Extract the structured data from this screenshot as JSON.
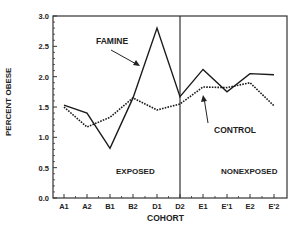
{
  "chart_data": {
    "type": "line",
    "title": "",
    "xlabel": "COHORT",
    "ylabel": "PERCENT OBESE",
    "ylim": [
      0.0,
      3.0
    ],
    "yticks": [
      "0.0",
      "0.5",
      "1.0",
      "1.5",
      "2.0",
      "2.5",
      "3.0"
    ],
    "categories": [
      "A1",
      "A2",
      "B1",
      "B2",
      "D1",
      "D2",
      "E1",
      "E'1",
      "E2",
      "E'2"
    ],
    "series": [
      {
        "name": "FAMINE",
        "style": "solid",
        "values": [
          1.53,
          1.4,
          0.82,
          1.65,
          2.8,
          1.67,
          2.12,
          1.75,
          2.05,
          2.03
        ]
      },
      {
        "name": "CONTROL",
        "style": "dotted",
        "values": [
          1.5,
          1.17,
          1.33,
          1.65,
          1.45,
          1.55,
          1.83,
          1.82,
          1.9,
          1.52
        ]
      }
    ],
    "annotations": [
      {
        "text": "FAMINE",
        "points_to": "famine line near D1"
      },
      {
        "text": "CONTROL",
        "points_to": "control line near E1"
      },
      {
        "text": "EXPOSED",
        "region": "A1–D2"
      },
      {
        "text": "NONEXPOSED",
        "region": "D2–E'2"
      }
    ],
    "divider_at": "D2",
    "grid": false,
    "legend": "none"
  },
  "labels": {
    "famine": "FAMINE",
    "control": "CONTROL",
    "exposed": "EXPOSED",
    "nonexposed": "NONEXPOSED"
  },
  "colors": {
    "line": "#1a1a1a",
    "axis": "#333333"
  }
}
